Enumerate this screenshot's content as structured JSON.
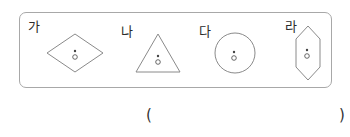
{
  "figure": {
    "items": [
      {
        "label": "가",
        "shape": "rhombus",
        "center_mark": "ㅎ-like point mark"
      },
      {
        "label": "나",
        "shape": "triangle",
        "center_mark": "ㅎ-like point mark"
      },
      {
        "label": "다",
        "shape": "circle",
        "center_mark": "ㅎ-like point mark"
      },
      {
        "label": "라",
        "shape": "hexagon",
        "center_mark": "ㅎ-like point mark"
      }
    ],
    "stroke_color": "#8a8a8a",
    "border_color": "#a8a8a8"
  },
  "answer": {
    "open_paren": "(",
    "close_paren": ")"
  }
}
